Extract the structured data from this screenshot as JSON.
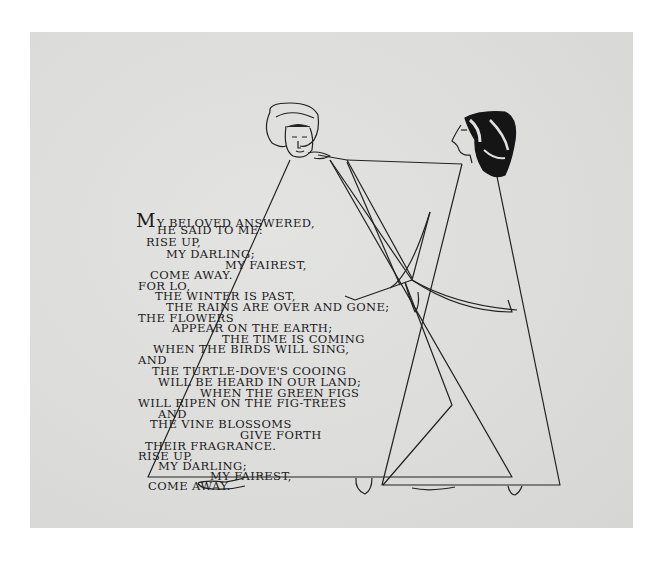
{
  "page": {
    "background_color": "#ffffff",
    "paper_color": "#dededd",
    "ink_color": "#1b1b1b"
  },
  "poem": {
    "lines": [
      "My beloved answered,",
      "he said to me:",
      "Rise up,",
      "my darling;",
      "my fairest,",
      "come away.",
      "For lo,",
      "the winter is past,",
      "the rains are over and gone;",
      "the flowers",
      "appear on the earth;",
      "the time is coming",
      "when the birds will sing,",
      "and",
      "the turtle-dove's cooing",
      "will be heard in our land;",
      "when the green figs",
      "will ripen on the fig-trees",
      "and",
      "the vine blossoms",
      "give forth",
      "their fragrance.",
      "Rise up,",
      "my darling;",
      "my fairest,",
      "come away."
    ]
  },
  "illustration": {
    "figures": [
      {
        "name": "male-figure",
        "headwear": "light turban"
      },
      {
        "name": "female-figure",
        "headwear": "dark striped headscarf"
      }
    ]
  }
}
